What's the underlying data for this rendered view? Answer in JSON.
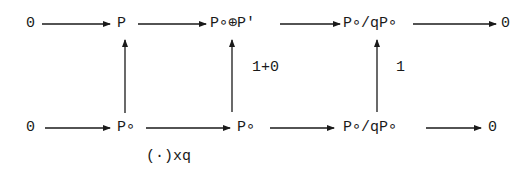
{
  "diagram": {
    "type": "commutative-diagram",
    "top_row": {
      "nodes": [
        "0",
        "P",
        "P∘⊕P'",
        "P∘/qP∘",
        "0"
      ]
    },
    "bottom_row": {
      "nodes": [
        "0",
        "P∘",
        "P∘",
        "P∘/qP∘",
        "0"
      ]
    },
    "vertical_maps": [
      {
        "from": "P∘",
        "to": "P",
        "label": ""
      },
      {
        "from": "P∘",
        "to": "P∘⊕P'",
        "label": "1+0"
      },
      {
        "from": "P∘/qP∘",
        "to": "P∘/qP∘",
        "label": "1"
      }
    ],
    "bottom_map_label": "(·)xq",
    "colors": {
      "ink": "#1a1a1a",
      "background": "#ffffff"
    }
  }
}
